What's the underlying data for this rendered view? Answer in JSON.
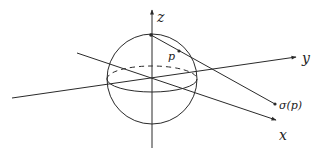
{
  "figure": {
    "stroke_color": "#2a2a2a",
    "background": "#ffffff"
  },
  "labels": {
    "z_axis": "z",
    "y_axis": "y",
    "x_axis": "x",
    "point_p": "p",
    "projection": "σ(p)"
  },
  "geometry": {
    "sphere": {
      "cx": 152,
      "cy": 79,
      "r": 45
    },
    "equator": {
      "rx": 45,
      "ry": 13
    },
    "north_pole": {
      "x": 151,
      "y": 35
    },
    "p": {
      "x": 179,
      "y": 51
    },
    "sigma_p": {
      "x": 275,
      "y": 104
    }
  }
}
